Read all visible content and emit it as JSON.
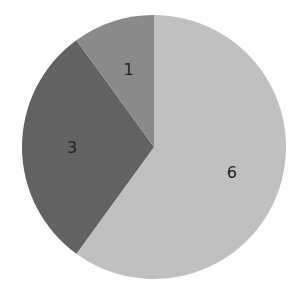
{
  "chart_data": {
    "type": "pie",
    "title": "",
    "categories": [
      "6",
      "3",
      "1"
    ],
    "values": [
      6,
      3,
      1
    ],
    "colors": [
      "#c0c0c0",
      "#626262",
      "#8a8a8a"
    ],
    "start_angle_deg": 0,
    "direction": "clockwise",
    "labels": [
      "6",
      "3",
      "1"
    ],
    "legend": null
  },
  "layout": {
    "cx": 154,
    "cy": 147,
    "r": 132,
    "label_radius_frac": 0.62
  }
}
